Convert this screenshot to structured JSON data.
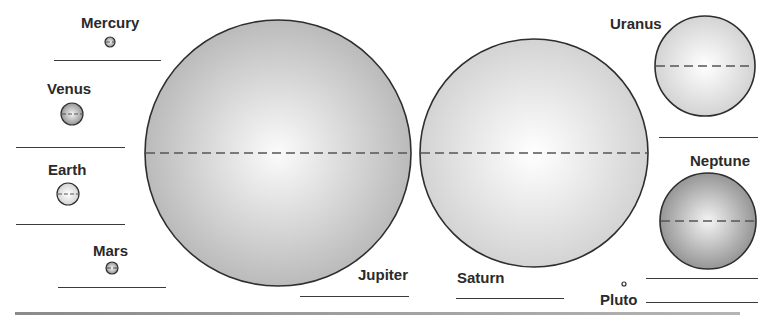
{
  "diagram": {
    "title_cutoff": "",
    "planets": [
      {
        "name": "Mercury",
        "cx": 110,
        "cy": 42,
        "r": 5,
        "shade": "dark",
        "label_x": 81,
        "label_y": 15
      },
      {
        "name": "Venus",
        "cx": 72,
        "cy": 114,
        "r": 11,
        "shade": "dark",
        "label_x": 47,
        "label_y": 81
      },
      {
        "name": "Earth",
        "cx": 68,
        "cy": 194,
        "r": 11,
        "shade": "light",
        "label_x": 48,
        "label_y": 162
      },
      {
        "name": "Mars",
        "cx": 112,
        "cy": 268,
        "r": 6,
        "shade": "dark",
        "label_x": 93,
        "label_y": 243
      },
      {
        "name": "Jupiter",
        "cx": 278,
        "cy": 153,
        "r": 133,
        "shade": "medium",
        "label_x": 358,
        "label_y": 267
      },
      {
        "name": "Saturn",
        "cx": 534,
        "cy": 153,
        "r": 114,
        "shade": "light",
        "label_x": 457,
        "label_y": 270
      },
      {
        "name": "Uranus",
        "cx": 705,
        "cy": 66,
        "r": 50,
        "shade": "light",
        "label_x": 610,
        "label_y": 16
      },
      {
        "name": "Neptune",
        "cx": 708,
        "cy": 221,
        "r": 48,
        "shade": "dark",
        "label_x": 690,
        "label_y": 153
      },
      {
        "name": "Pluto",
        "cx": 624,
        "cy": 284,
        "r": 2,
        "shade": "none",
        "label_x": 600,
        "label_y": 292
      }
    ],
    "answer_lines": [
      {
        "for": "Mercury",
        "x": 54,
        "y": 60,
        "w": 107
      },
      {
        "for": "Venus",
        "x": 16,
        "y": 147,
        "w": 109
      },
      {
        "for": "Earth",
        "x": 16,
        "y": 224,
        "w": 109
      },
      {
        "for": "Mars",
        "x": 58,
        "y": 287,
        "w": 108
      },
      {
        "for": "Jupiter",
        "x": 300,
        "y": 296,
        "w": 109
      },
      {
        "for": "Saturn",
        "x": 456,
        "y": 298,
        "w": 108
      },
      {
        "for": "Uranus",
        "x": 659,
        "y": 137,
        "w": 99
      },
      {
        "for": "Neptune",
        "x": 646,
        "y": 278,
        "w": 112
      },
      {
        "for": "Pluto",
        "x": 646,
        "y": 302,
        "w": 112
      }
    ],
    "colors": {
      "outline": "#2e2e2e",
      "equator_dash": "#555555",
      "dark_fill_edge": "#8c8c8c",
      "medium_fill_edge": "#b4b4b4",
      "light_fill_edge": "#cfcfcf",
      "highlight": "#ffffff"
    }
  }
}
